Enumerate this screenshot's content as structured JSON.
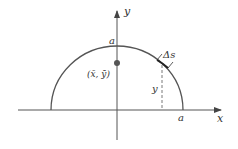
{
  "diagram": {
    "type": "semicircle-centroid",
    "axes": {
      "x_label": "x",
      "y_label": "y"
    },
    "labels": {
      "radius_top": "a",
      "radius_right": "a",
      "centroid": "(x̄, ȳ)",
      "arc_element": "Δs",
      "height": "y"
    },
    "colors": {
      "stroke": "#555555",
      "text": "#333333",
      "dot": "#555555"
    }
  }
}
